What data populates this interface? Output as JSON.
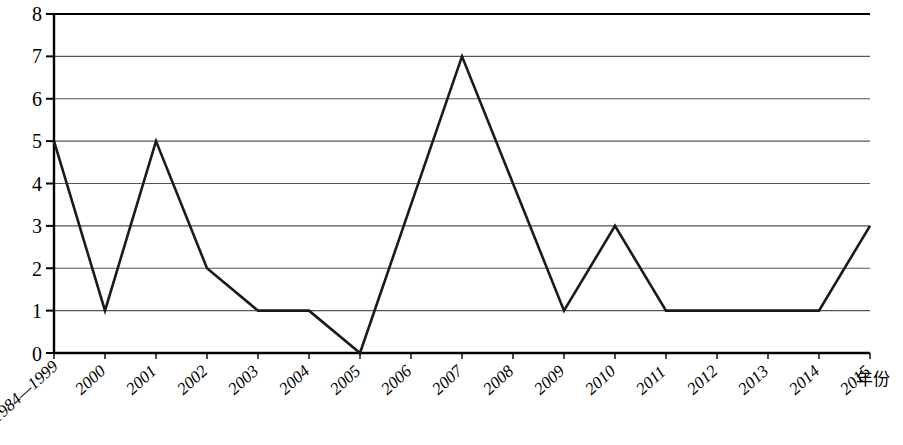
{
  "chart_data": {
    "type": "line",
    "title": "",
    "subtitle": "",
    "xlabel": "年份",
    "ylabel": "",
    "categories": [
      "1984—1999",
      "2000",
      "2001",
      "2002",
      "2003",
      "2004",
      "2005",
      "2006",
      "2007",
      "2008",
      "2009",
      "2010",
      "2011",
      "2012",
      "2013",
      "2014",
      "2015"
    ],
    "values": [
      5,
      1,
      5,
      2,
      1,
      1,
      0,
      3.5,
      7,
      4,
      1,
      3,
      1,
      1,
      1,
      1,
      3
    ],
    "series": [
      {
        "name": "",
        "values": [
          5,
          1,
          5,
          2,
          1,
          1,
          0,
          3.5,
          7,
          4,
          1,
          3,
          1,
          1,
          1,
          1,
          3
        ]
      }
    ],
    "ylim": [
      0,
      8
    ],
    "ytick_labels": [
      "0",
      "1",
      "2",
      "3",
      "4",
      "5",
      "6",
      "7",
      "8"
    ],
    "ytick_values": [
      0,
      1,
      2,
      3,
      4,
      5,
      6,
      7,
      8
    ],
    "grid": true,
    "grid_axis": "y",
    "legend": "none",
    "legend_position": "none",
    "line_color": "#1a1a1a",
    "grid_color": "#555555",
    "axis_color": "#000000",
    "background_color": "#ffffff",
    "annotations": []
  },
  "axes": {
    "x_axis_title": "年份",
    "y_axis_title": ""
  }
}
